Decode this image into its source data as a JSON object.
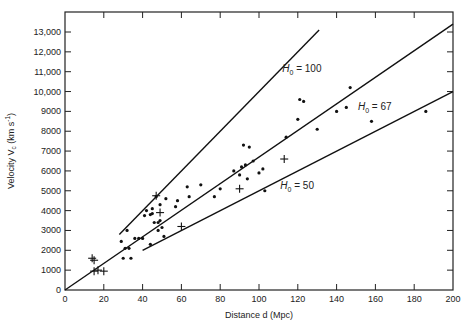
{
  "chart_data": {
    "type": "scatter",
    "title": "",
    "xlabel": "Distance d (Mpc)",
    "ylabel": "Velocity V_c (km s^-1)",
    "xlim": [
      0,
      200
    ],
    "ylim": [
      0,
      14000
    ],
    "grid": false,
    "legend": "none",
    "x_ticks": [
      0,
      20,
      40,
      60,
      80,
      100,
      120,
      140,
      160,
      180,
      200
    ],
    "y_ticks": [
      0,
      1000,
      2000,
      3000,
      4000,
      5000,
      6000,
      7000,
      8000,
      9000,
      10000,
      11000,
      12000,
      13000
    ],
    "y_tick_labels": [
      "0",
      "1000",
      "2000",
      "3000",
      "4000",
      "5000",
      "6000",
      "7000",
      "8000",
      "9000",
      "10,000",
      "11,000",
      "12,000",
      "13,000"
    ],
    "lines": [
      {
        "name": "H0 = 100",
        "label_main": "H",
        "label_sub": "0",
        "label_rest": " = 100",
        "slope": 100,
        "x_range": [
          28,
          131
        ],
        "label_at": [
          112,
          11000
        ]
      },
      {
        "name": "H0 = 67",
        "label_main": "H",
        "label_sub": "0",
        "label_rest": " = 67",
        "slope": 67,
        "x_range": [
          0,
          200
        ],
        "label_at": [
          151,
          9050
        ]
      },
      {
        "name": "H0 = 50",
        "label_main": "H",
        "label_sub": "0",
        "label_rest": " = 50",
        "slope": 50,
        "x_range": [
          40,
          200
        ],
        "label_at": [
          111,
          5100
        ]
      }
    ],
    "series": [
      {
        "name": "galaxies (dots)",
        "marker": "dot",
        "points": [
          [
            29,
            2450
          ],
          [
            30,
            1600
          ],
          [
            31,
            2100
          ],
          [
            32,
            3000
          ],
          [
            33,
            2100
          ],
          [
            34,
            1600
          ],
          [
            36,
            2600
          ],
          [
            38,
            2600
          ],
          [
            40,
            2600
          ],
          [
            41,
            3750
          ],
          [
            42,
            4000
          ],
          [
            44,
            2300
          ],
          [
            44,
            3800
          ],
          [
            45,
            3850
          ],
          [
            45,
            4100
          ],
          [
            46,
            3400
          ],
          [
            47,
            4700
          ],
          [
            48,
            3400
          ],
          [
            48,
            3000
          ],
          [
            49,
            4300
          ],
          [
            49,
            3500
          ],
          [
            50,
            3150
          ],
          [
            51,
            2700
          ],
          [
            52,
            4600
          ],
          [
            57,
            4200
          ],
          [
            58,
            4500
          ],
          [
            63,
            5200
          ],
          [
            64,
            4700
          ],
          [
            70,
            5300
          ],
          [
            77,
            4700
          ],
          [
            80,
            5100
          ],
          [
            87,
            6000
          ],
          [
            90,
            5800
          ],
          [
            91,
            6200
          ],
          [
            92,
            7300
          ],
          [
            93,
            6300
          ],
          [
            94,
            5600
          ],
          [
            95,
            7200
          ],
          [
            97,
            6500
          ],
          [
            100,
            5900
          ],
          [
            102,
            6100
          ],
          [
            103,
            5000
          ],
          [
            114,
            7700
          ],
          [
            120,
            8600
          ],
          [
            121,
            9600
          ],
          [
            123,
            9500
          ],
          [
            130,
            8100
          ],
          [
            140,
            9000
          ],
          [
            145,
            9200
          ],
          [
            147,
            10200
          ],
          [
            158,
            8500
          ],
          [
            186,
            9000
          ]
        ]
      },
      {
        "name": "calibrators (crosses)",
        "marker": "cross",
        "points": [
          [
            14,
            1600
          ],
          [
            15,
            1500
          ],
          [
            15,
            950
          ],
          [
            17,
            1000
          ],
          [
            20,
            950
          ],
          [
            47,
            4750
          ],
          [
            49,
            3900
          ],
          [
            60,
            3200
          ],
          [
            90,
            5100
          ],
          [
            113,
            6600
          ]
        ]
      }
    ]
  }
}
